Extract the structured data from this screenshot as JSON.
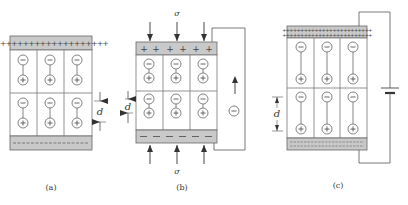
{
  "figure": {
    "panels": [
      {
        "id": "a",
        "caption": "(a)",
        "top_plate_charge": "+",
        "bottom_plate_charge": "−",
        "dimension_label": "d",
        "dipole_sign_neg": "−",
        "dipole_sign_pos": "+"
      },
      {
        "id": "b",
        "caption": "(b)",
        "top_plate_charge": "+",
        "bottom_plate_charge": "−",
        "dimension_label": "d",
        "stress_label_top": "σ",
        "stress_label_bottom": "σ",
        "current_carrier": "−"
      },
      {
        "id": "c",
        "caption": "(c)",
        "top_plate_charge": "+",
        "bottom_plate_charge": "−",
        "dimension_label": "d",
        "source": "battery"
      }
    ],
    "colors": {
      "plate_fill": "#c9c9c9",
      "line": "#555555",
      "cell_border": "#777777",
      "text": "#333333"
    }
  }
}
